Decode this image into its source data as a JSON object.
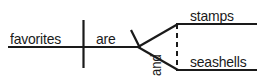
{
  "diagram": {
    "type": "reed-kellogg-sentence-diagram",
    "sentence": "favorites are stamps and seashells",
    "ink_color": "#1a1a1a",
    "background_color": "#ffffff",
    "labels": {
      "subject": "favorites",
      "verb": "are",
      "complement_first": "stamps",
      "complement_second": "seashells",
      "conjunction": "and"
    },
    "lines": {
      "baseline_label": "main horizontal baseline",
      "subject_verb_divider_label": "vertical subject-verb divider",
      "conjunction_connector_label": "dashed conjunction connector",
      "complement_fork_label": "compound complement fork"
    }
  }
}
